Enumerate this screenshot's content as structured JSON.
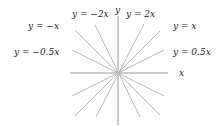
{
  "diagram": {
    "origin": {
      "x": 118,
      "y": 73
    },
    "axes": {
      "x_label": "x",
      "y_label": "y"
    },
    "lines": [
      {
        "id": "neg-0.5",
        "label": "y = −0.5x",
        "slope": -0.5
      },
      {
        "id": "neg-1",
        "label": "y = −x",
        "slope": -1
      },
      {
        "id": "neg-2",
        "label": "y = −2x",
        "slope": -2
      },
      {
        "id": "pos-2",
        "label": "y = 2x",
        "slope": 2
      },
      {
        "id": "pos-1",
        "label": "y = x",
        "slope": 1
      },
      {
        "id": "pos-0.5",
        "label": "y = 0.5x",
        "slope": 0.5
      }
    ],
    "colors": {
      "lines": "#b8b8b8",
      "axes": "#999999",
      "text": "#222222"
    }
  }
}
